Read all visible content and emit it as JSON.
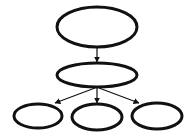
{
  "diagram": {
    "type": "tree",
    "width": 195,
    "height": 140,
    "background": "#ffffff",
    "stroke_color": "#111111",
    "nodes": [
      {
        "id": "root",
        "label": "",
        "cx": 97,
        "cy": 27,
        "rx": 40,
        "ry": 20
      },
      {
        "id": "middle",
        "label": "",
        "cx": 97,
        "cy": 75,
        "rx": 40,
        "ry": 12
      },
      {
        "id": "child-left",
        "label": "",
        "cx": 38,
        "cy": 116,
        "rx": 24,
        "ry": 12
      },
      {
        "id": "child-center",
        "label": "",
        "cx": 97,
        "cy": 117,
        "rx": 25,
        "ry": 13
      },
      {
        "id": "child-right",
        "label": "",
        "cx": 157,
        "cy": 116,
        "rx": 25,
        "ry": 13
      }
    ],
    "edges": [
      {
        "from": "root",
        "to": "middle",
        "x1": 97,
        "y1": 47,
        "x2": 97,
        "y2": 62
      },
      {
        "from": "middle",
        "to": "child-left",
        "x1": 95,
        "y1": 88,
        "x2": 55,
        "y2": 103
      },
      {
        "from": "middle",
        "to": "child-center",
        "x1": 97,
        "y1": 88,
        "x2": 97,
        "y2": 103
      },
      {
        "from": "middle",
        "to": "child-right",
        "x1": 99,
        "y1": 88,
        "x2": 139,
        "y2": 103
      }
    ]
  }
}
